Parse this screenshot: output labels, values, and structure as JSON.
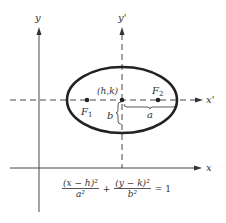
{
  "diagram": {
    "axes": {
      "x_label": "x",
      "y_label": "y",
      "x_prime_label": "x'",
      "y_prime_label": "y'"
    },
    "center_label": "(h,k)",
    "foci": [
      {
        "label": "F",
        "sub": "1"
      },
      {
        "label": "F",
        "sub": "2"
      }
    ],
    "semi_major_label": "a",
    "semi_minor_label": "b",
    "equation": {
      "term1_num": "(x − h)²",
      "term1_den": "a²",
      "plus": "+",
      "term2_num": "(y − k)²",
      "term2_den": "b²",
      "rhs": "= 1"
    }
  }
}
